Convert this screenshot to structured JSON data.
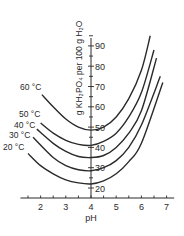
{
  "chart_data": {
    "type": "line",
    "title": "",
    "xlabel": "pH",
    "ylabel": "g KH₂PO₄ per 100 g H₂O",
    "xlim": [
      1.2,
      7.3
    ],
    "ylim": [
      15,
      97
    ],
    "x_ticks": [
      2,
      3,
      4,
      5,
      6,
      7
    ],
    "y_ticks": [
      20,
      30,
      40,
      50,
      60,
      70,
      80,
      90
    ],
    "grid": false,
    "legend": "inline curve labels at left end",
    "series": [
      {
        "name": "60 °C",
        "label": "60 °C",
        "points": [
          [
            2.05,
            66
          ],
          [
            2.5,
            60
          ],
          [
            3,
            54
          ],
          [
            3.5,
            50
          ],
          [
            4,
            48.5
          ],
          [
            4.5,
            50
          ],
          [
            5,
            55
          ],
          [
            5.5,
            64
          ],
          [
            6,
            78
          ],
          [
            6.35,
            95
          ]
        ]
      },
      {
        "name": "50 °C",
        "label": "50 °C",
        "points": [
          [
            2.0,
            52
          ],
          [
            2.5,
            47
          ],
          [
            3,
            43.5
          ],
          [
            3.5,
            41.5
          ],
          [
            4,
            41
          ],
          [
            4.5,
            43
          ],
          [
            5,
            47
          ],
          [
            5.5,
            55
          ],
          [
            6,
            67
          ],
          [
            6.5,
            88
          ]
        ]
      },
      {
        "name": "40 °C",
        "label": "40 °C",
        "points": [
          [
            1.85,
            49
          ],
          [
            2.5,
            42
          ],
          [
            3,
            38
          ],
          [
            3.5,
            35.5
          ],
          [
            4,
            35
          ],
          [
            4.5,
            36
          ],
          [
            5,
            40
          ],
          [
            5.5,
            47
          ],
          [
            6,
            58
          ],
          [
            6.6,
            84
          ]
        ]
      },
      {
        "name": "30 °C",
        "label": "30 °C",
        "points": [
          [
            1.7,
            45
          ],
          [
            2.5,
            35
          ],
          [
            3,
            31
          ],
          [
            3.5,
            29
          ],
          [
            4,
            28.5
          ],
          [
            4.5,
            30
          ],
          [
            5,
            33.5
          ],
          [
            5.5,
            40
          ],
          [
            6,
            51
          ],
          [
            6.75,
            75
          ]
        ]
      },
      {
        "name": "20 °C",
        "label": "20 °C",
        "points": [
          [
            1.5,
            37
          ],
          [
            2,
            31
          ],
          [
            2.5,
            27
          ],
          [
            3,
            24
          ],
          [
            3.5,
            22.5
          ],
          [
            4,
            22
          ],
          [
            4.5,
            23.5
          ],
          [
            5,
            27
          ],
          [
            5.5,
            33
          ],
          [
            6,
            42
          ],
          [
            6.85,
            72
          ]
        ]
      }
    ],
    "label_positions": [
      {
        "text": "60 °C",
        "x": 20,
        "y": 90
      },
      {
        "text": "50 °C",
        "x": 19,
        "y": 117
      },
      {
        "text": "40 °C",
        "x": 14,
        "y": 128
      },
      {
        "text": "30 °C",
        "x": 9,
        "y": 138
      },
      {
        "text": "20 °C",
        "x": 3,
        "y": 150
      }
    ],
    "colors": {
      "line": "#2a2a2a",
      "background": "#ffffff"
    }
  }
}
